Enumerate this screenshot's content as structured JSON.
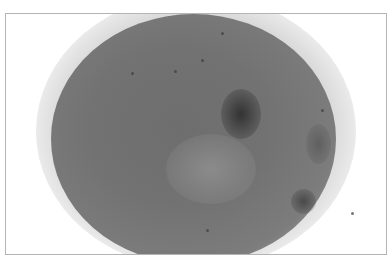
{
  "image": {
    "description": "Grayscale micrograph of a roughly circular tissue/particle specimen on white background within a thin gray frame",
    "colors": {
      "background": "#ffffff",
      "frame_border": "#b4b4b4",
      "specimen_core": "#6e6e6e",
      "specimen_edge": "#9a9a9a",
      "dark_inclusions": "#2a2a2a"
    }
  }
}
